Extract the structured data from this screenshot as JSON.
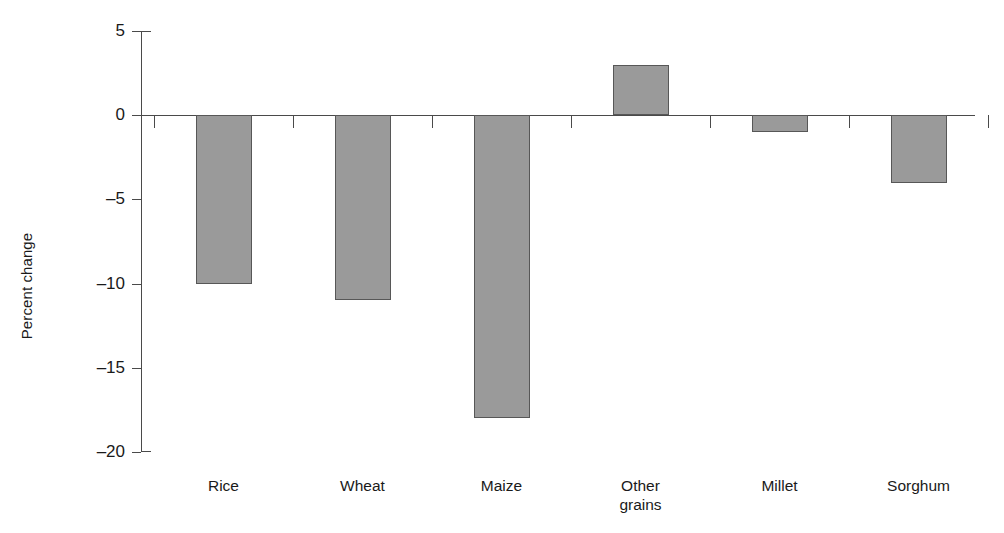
{
  "chart_data": {
    "type": "bar",
    "title": "",
    "subtitle": "",
    "xlabel": "",
    "ylabel": "Percent change",
    "categories": [
      "Rice",
      "Wheat",
      "Maize",
      "Other grains",
      "Millet",
      "Sorghum"
    ],
    "category_lines": [
      [
        "Rice"
      ],
      [
        "Wheat"
      ],
      [
        "Maize"
      ],
      [
        "Other",
        "grains"
      ],
      [
        "Millet"
      ],
      [
        "Sorghum"
      ]
    ],
    "values": [
      -10,
      -11,
      -18,
      3,
      -1,
      -4
    ],
    "ylim": [
      -20,
      5
    ],
    "yticks": [
      5,
      0,
      -5,
      -10,
      -15,
      -20
    ],
    "ytick_labels": [
      "5",
      "0",
      "–5",
      "–10",
      "–15",
      "–20"
    ],
    "grid": false,
    "legend": false,
    "legend_position": "none",
    "bar_fill_color": "#9a9a9a",
    "bar_edge_color": "#575757",
    "axis_color": "#4a4a4a",
    "background_color": "#ffffff",
    "zero_reference_line": 0
  }
}
